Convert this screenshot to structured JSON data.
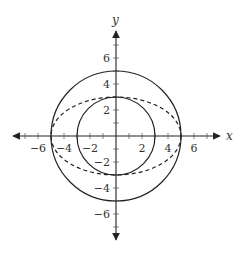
{
  "chart_data": {
    "type": "line",
    "title": "",
    "xlabel": "x",
    "ylabel": "y",
    "xlim": [
      -7.5,
      7.5
    ],
    "ylim": [
      -7.5,
      7.5
    ],
    "grid": false,
    "x_ticks": [
      -6,
      -4,
      -2,
      2,
      4,
      6
    ],
    "y_ticks": [
      -6,
      -4,
      -2,
      2,
      4,
      6
    ],
    "x_tick_labels": [
      "−6",
      "−4",
      "−2",
      "2",
      "4",
      "6"
    ],
    "y_tick_labels": [
      "−6",
      "−4",
      "−2",
      "2",
      "4",
      "6"
    ],
    "series": [
      {
        "name": "outer circle",
        "shape": "circle",
        "center": [
          0,
          0
        ],
        "radius": 5,
        "style": "solid",
        "equation": "x^2 + y^2 = 25"
      },
      {
        "name": "inner circle",
        "shape": "circle",
        "center": [
          0,
          0
        ],
        "radius": 3,
        "style": "solid",
        "equation": "x^2 + y^2 = 9"
      },
      {
        "name": "ellipse",
        "shape": "ellipse",
        "center": [
          0,
          0
        ],
        "semi_axes": [
          5,
          3
        ],
        "style": "dashed",
        "equation": "x^2/25 + y^2/9 = 1"
      }
    ]
  },
  "axes": {
    "x_label": "x",
    "y_label": "y",
    "origin_px": [
      116,
      136
    ],
    "scale_px_per_unit": 13
  },
  "colors": {
    "stroke": "#222222",
    "text": "#333333"
  }
}
